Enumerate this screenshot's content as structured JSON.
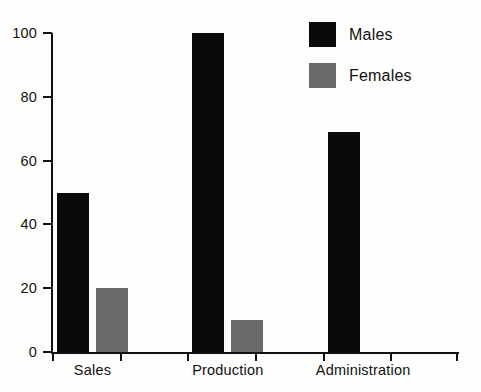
{
  "chart_data": {
    "type": "bar",
    "title": "",
    "subtitle": "",
    "xlabel": "",
    "ylabel": "",
    "categories": [
      "Sales",
      "Production",
      "Administration"
    ],
    "series": [
      {
        "name": "Males",
        "color": "#0a0a0a",
        "values": [
          50,
          100,
          69
        ]
      },
      {
        "name": "Females",
        "color": "#6a6a6a",
        "values": [
          20,
          10,
          0
        ]
      }
    ],
    "ylim": [
      0,
      100
    ],
    "yticks": [
      0,
      20,
      40,
      60,
      80,
      100
    ],
    "ytick_labels": [
      "0",
      "20",
      "40",
      "60",
      "80",
      "100"
    ],
    "grid": false,
    "legend_position": "top-right",
    "legend_entries": [
      {
        "label": "Males",
        "color": "#0a0a0a"
      },
      {
        "label": "Females",
        "color": "#6a6a6a"
      }
    ],
    "annotations": []
  },
  "colors": {
    "background": "#fdfdfb",
    "axis": "#111111",
    "males": "#0a0a0a",
    "females": "#6a6a6a"
  }
}
